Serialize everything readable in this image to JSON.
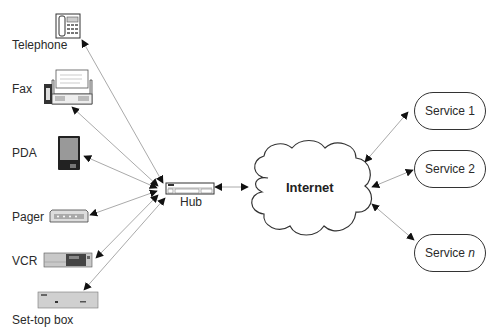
{
  "devices": [
    {
      "id": "telephone",
      "label": "Telephone"
    },
    {
      "id": "fax",
      "label": "Fax"
    },
    {
      "id": "pda",
      "label": "PDA"
    },
    {
      "id": "pager",
      "label": "Pager"
    },
    {
      "id": "vcr",
      "label": "VCR"
    },
    {
      "id": "settop",
      "label": "Set-top box"
    }
  ],
  "hub": {
    "label": "Hub"
  },
  "internet": {
    "label": "Internet"
  },
  "services": [
    {
      "label": "Service 1"
    },
    {
      "label": "Service 2"
    },
    {
      "label_prefix": "Service ",
      "label_italic": "n"
    }
  ],
  "colors": {
    "line": "#aaaaaa",
    "arrow": "#111111",
    "outline": "#333333",
    "device_fill": "#c8c8c8"
  }
}
